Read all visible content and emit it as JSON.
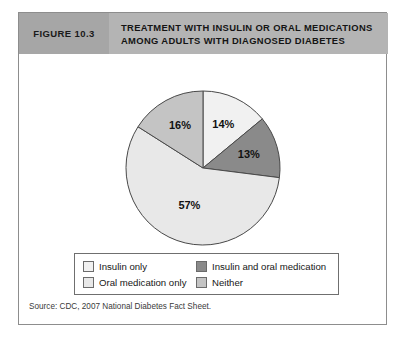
{
  "figure": {
    "number_label": "FIGURE 10.3",
    "title_line_1": "TREATMENT WITH INSULIN OR ORAL MEDICATIONS",
    "title_line_2": "AMONG ADULTS WITH DIAGNOSED DIABETES",
    "source": "Source: CDC, 2007 National Diabetes Fact Sheet."
  },
  "colors": {
    "header_band": "#b4b4b4",
    "header_number_box": "#a6a6a6",
    "frame_border": "#8d8d8d",
    "insulin_only": "#f1f1f1",
    "insulin_and_oral": "#8a8a8a",
    "oral_only": "#e8e8e8",
    "neither": "#c4c4c4",
    "slice_outline": "#4a4a4a",
    "label_text": "#111111"
  },
  "legend": {
    "items": [
      {
        "label": "Insulin only",
        "color": "#f1f1f1"
      },
      {
        "label": "Insulin and oral medication",
        "color": "#8a8a8a"
      },
      {
        "label": "Oral medication only",
        "color": "#e8e8e8"
      },
      {
        "label": "Neither",
        "color": "#c4c4c4"
      }
    ]
  },
  "chart_data": {
    "type": "pie",
    "title": "TREATMENT WITH INSULIN OR ORAL MEDICATIONS AMONG ADULTS WITH DIAGNOSED DIABETES",
    "subtitle": "",
    "xlabel": "",
    "ylabel": "",
    "unit": "%",
    "legend_position": "bottom",
    "grid": false,
    "start_angle_deg": 0,
    "direction": "clockwise",
    "categories": [
      "Insulin only",
      "Insulin and oral medication",
      "Oral medication only",
      "Neither"
    ],
    "values": [
      14,
      13,
      57,
      16
    ],
    "data_labels": [
      "14%",
      "13%",
      "57%",
      "16%"
    ],
    "colors": [
      "#f1f1f1",
      "#8a8a8a",
      "#e8e8e8",
      "#c4c4c4"
    ],
    "total": 100,
    "source": "CDC, 2007 National Diabetes Fact Sheet"
  }
}
